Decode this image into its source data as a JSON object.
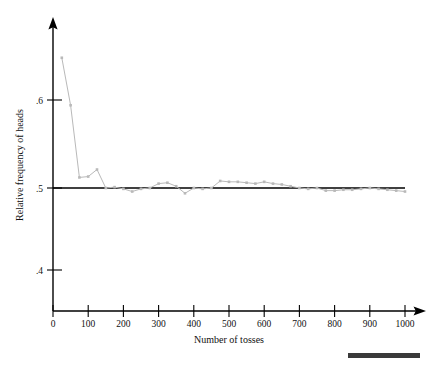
{
  "chart_data": {
    "type": "line",
    "title": "",
    "subtitle": "",
    "xlabel": "Number of tosses",
    "ylabel": "Relative frequency of heads",
    "xlim": [
      0,
      1000
    ],
    "ylim": [
      0.355,
      0.655
    ],
    "xticks": [
      0,
      100,
      200,
      300,
      400,
      500,
      600,
      700,
      800,
      900,
      1000
    ],
    "xtick_labels": [
      "0",
      "100",
      "200",
      "300",
      "400",
      "500",
      "600",
      "700",
      "800",
      "900",
      "1000"
    ],
    "yticks": [
      0.4,
      0.5,
      0.6
    ],
    "ytick_labels": [
      ".4",
      ".5",
      ".6"
    ],
    "grid": false,
    "legend": null,
    "reference_line": {
      "name": "half-line",
      "orientation": "horizontal",
      "y": 0.5,
      "x_start": 0,
      "x_end": 1000,
      "color": "#000000",
      "label": ""
    },
    "series": [
      {
        "name": "Relative frequency of heads",
        "color": "#b9b9b9",
        "marker": "square",
        "x": [
          25,
          50,
          75,
          100,
          125,
          150,
          175,
          200,
          225,
          250,
          275,
          300,
          325,
          350,
          375,
          400,
          425,
          450,
          475,
          500,
          525,
          550,
          575,
          600,
          625,
          650,
          675,
          700,
          725,
          750,
          775,
          800,
          825,
          850,
          875,
          900,
          925,
          950,
          975,
          1000
        ],
        "y": [
          0.648,
          0.594,
          0.512,
          0.513,
          0.521,
          0.5,
          0.501,
          0.499,
          0.496,
          0.499,
          0.5,
          0.505,
          0.506,
          0.502,
          0.494,
          0.5,
          0.499,
          0.5,
          0.508,
          0.507,
          0.507,
          0.506,
          0.505,
          0.507,
          0.505,
          0.504,
          0.502,
          0.5,
          0.499,
          0.5,
          0.497,
          0.497,
          0.498,
          0.498,
          0.499,
          0.5,
          0.499,
          0.498,
          0.497,
          0.496
        ]
      }
    ]
  },
  "axes": {
    "y_axis_name": "relative-frequency-axis",
    "x_axis_name": "number-of-tosses-axis"
  },
  "footer": {
    "bar_color": "#3a3a3a",
    "bar_label": ""
  }
}
